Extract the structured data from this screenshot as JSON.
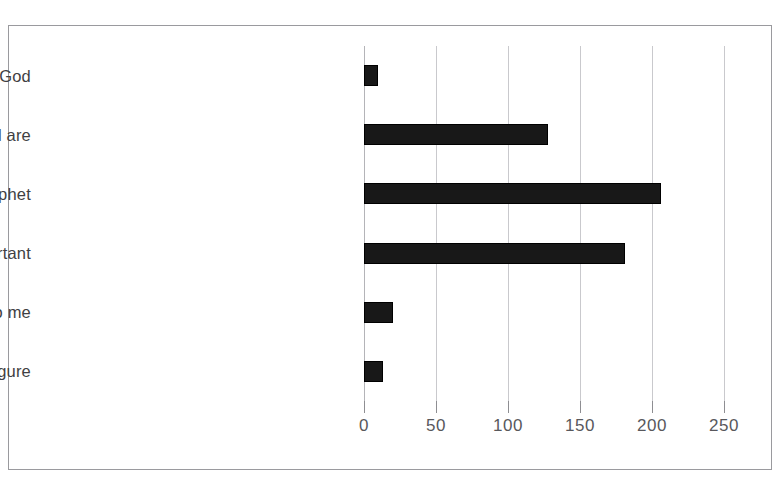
{
  "caption": {
    "clipped_text": ""
  },
  "chart_data": {
    "type": "bar",
    "orientation": "horizontal",
    "title": "",
    "xlabel": "",
    "ylabel": "",
    "grid": true,
    "legend": false,
    "xlim": [
      0,
      250
    ],
    "xticks": [
      0,
      50,
      100,
      150,
      200,
      250
    ],
    "xtick_labels": [
      "0",
      "50",
      "100",
      "150",
      "200",
      "250"
    ],
    "categories": [
      "Son of God",
      "A son of God, as we all are",
      "Human 1st century Jewish prophet",
      "Teachings, example more important",
      "Story / man irrelevant to me",
      "Mythical figure"
    ],
    "values": [
      10,
      128,
      206,
      181,
      20,
      13
    ],
    "bar_color": "#181818",
    "grid_color": "#c9c9cd",
    "frame_color": "#9a9a9e",
    "text_color": "#3f3f43"
  }
}
